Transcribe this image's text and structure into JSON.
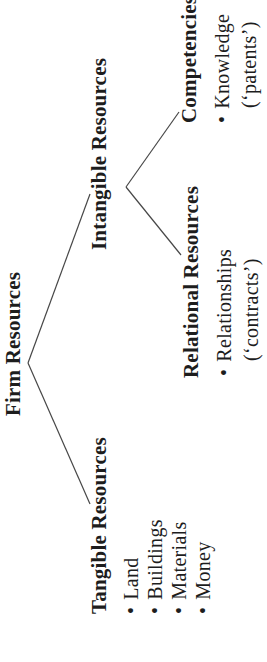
{
  "diagram": {
    "bullet": "•",
    "root": {
      "label": "Firm Resources"
    },
    "tangible": {
      "label": "Tangible Resources",
      "items": [
        "Land",
        "Buildings",
        "Materials",
        "Money"
      ]
    },
    "intangible": {
      "label": "Intangible Resources"
    },
    "relational": {
      "label": "Relational Resources",
      "item_line1": "Relationships",
      "item_line2": "(‘contracts’)"
    },
    "competencies": {
      "label": "Competencies",
      "item_line1": "Knowledge",
      "item_line2": "(‘patents’)"
    },
    "colors": {
      "text": "#1d1d1d",
      "line": "#474747",
      "background": "#ffffff"
    }
  }
}
